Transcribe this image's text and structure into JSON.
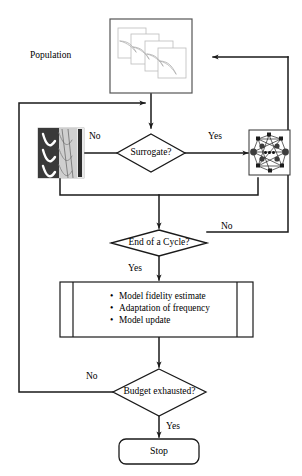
{
  "diagram": {
    "type": "flowchart",
    "colors": {
      "line": "#1a1a1a",
      "text": "#000000",
      "background": "#ffffff",
      "population_box_border": "#555555",
      "cfd_image_dark": "#3a3a3a",
      "network_box_border": "#333333"
    },
    "nodes": {
      "population_label": "Population",
      "population_box": "population-thumbnail-stack",
      "surrogate_decision": "Surrogate?",
      "cfd_image": "cfd-simulation-thumbnail",
      "network_image": "neural-network-thumbnail",
      "cycle_decision": "End of a Cycle?",
      "process_items": [
        "Model fidelity estimate",
        "Adaptation of frequency",
        "Model update"
      ],
      "budget_decision": "Budget exhausted?",
      "stop": "Stop"
    },
    "edge_labels": {
      "surrogate_no": "No",
      "surrogate_yes": "Yes",
      "cycle_no": "No",
      "cycle_yes": "Yes",
      "budget_no": "No",
      "budget_yes": "Yes"
    }
  }
}
